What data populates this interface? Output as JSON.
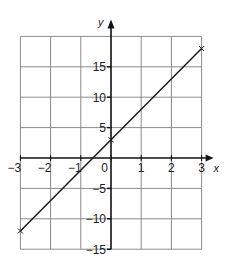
{
  "chart_data": {
    "type": "line",
    "title": "",
    "xlabel": "x",
    "ylabel": "y",
    "xlim": [
      -3,
      3
    ],
    "ylim": [
      -15,
      20
    ],
    "grid": true,
    "x_ticks": [
      -3,
      -2,
      -1,
      0,
      1,
      2,
      3
    ],
    "x_tick_labels": [
      "−3",
      "−2",
      "−1",
      "0",
      "1",
      "2",
      "3"
    ],
    "y_ticks": [
      -15,
      -10,
      -5,
      5,
      10,
      15
    ],
    "y_tick_labels": [
      "−15",
      "−10",
      "−5",
      "5",
      "10",
      "15"
    ],
    "series": [
      {
        "name": "y = 5x + 3",
        "x": [
          -3,
          0,
          3
        ],
        "y": [
          -12,
          3,
          18
        ],
        "markers": [
          [
            -3,
            -12
          ],
          [
            0,
            3
          ],
          [
            3,
            18
          ]
        ]
      }
    ],
    "legend": "none"
  },
  "labels": {
    "x_axis": "x",
    "y_axis": "y"
  },
  "colors": {
    "grid": "#8a8a8a",
    "axis": "#111111",
    "line": "#1a1a1a"
  }
}
